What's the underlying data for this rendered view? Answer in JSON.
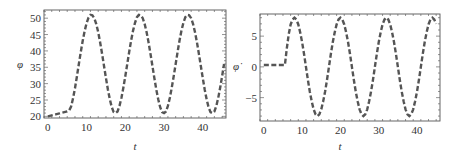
{
  "chart_data": [
    {
      "type": "line",
      "title": "",
      "xlabel": "t",
      "ylabel": "φ",
      "xlim": [
        -1,
        46
      ],
      "ylim": [
        19.5,
        52.5
      ],
      "x_ticks": [
        0,
        10,
        20,
        30,
        40
      ],
      "x_tick_labels": [
        "0",
        "10",
        "20",
        "30",
        "40"
      ],
      "y_ticks": [
        20,
        25,
        30,
        35,
        40,
        45,
        50
      ],
      "y_tick_labels": [
        "20",
        "25",
        "30",
        "35",
        "40",
        "45",
        "50"
      ],
      "grid": false,
      "legend": null,
      "series": [
        {
          "name": "phi",
          "style": "dashed",
          "color": "#555555",
          "x": [
            0,
            1,
            2,
            3,
            4,
            5,
            5.5,
            6,
            6.5,
            7,
            7.5,
            8,
            8.5,
            9,
            9.5,
            10,
            10.5,
            11,
            11.5,
            12,
            12.5,
            13,
            13.5,
            14,
            14.5,
            15,
            15.5,
            16,
            16.5,
            17,
            17.5,
            18,
            18.5,
            19,
            19.5,
            20,
            20.5,
            21,
            21.5,
            22,
            22.5,
            23,
            23.5,
            24,
            24.5,
            25,
            25.5,
            26,
            26.5,
            27,
            27.5,
            28,
            28.5,
            29,
            29.5,
            30,
            30.5,
            31,
            31.5,
            32,
            32.5,
            33,
            33.5,
            34,
            34.5,
            35,
            35.5,
            36,
            36.5,
            37,
            37.5,
            38,
            38.5,
            39,
            39.5,
            40,
            40.5,
            41,
            41.5,
            42,
            42.5,
            43,
            43.5,
            44,
            44.5,
            45,
            45.5
          ],
          "y": [
            20.0,
            20.3,
            20.6,
            20.9,
            21.2,
            21.5,
            21.8,
            23.0,
            25.5,
            28.6,
            32.2,
            36.0,
            39.7,
            43.1,
            46.1,
            48.5,
            50.2,
            51.0,
            50.9,
            50.0,
            48.2,
            45.7,
            42.6,
            39.1,
            35.4,
            31.7,
            28.2,
            25.2,
            22.8,
            21.3,
            21.0,
            21.5,
            23.2,
            25.7,
            28.8,
            32.3,
            36.0,
            39.7,
            43.2,
            46.2,
            48.6,
            50.3,
            51.0,
            50.9,
            50.0,
            48.2,
            45.7,
            42.6,
            39.1,
            35.4,
            31.7,
            28.2,
            25.2,
            22.8,
            21.3,
            21.0,
            21.5,
            23.2,
            25.7,
            28.8,
            32.3,
            36.0,
            39.7,
            43.2,
            46.2,
            48.6,
            50.3,
            51.0,
            50.9,
            50.0,
            48.2,
            45.7,
            42.6,
            39.1,
            35.4,
            31.7,
            28.2,
            25.2,
            22.8,
            21.3,
            21.0,
            21.5,
            23.2,
            25.7,
            28.8,
            32.3,
            36.0,
            39.7,
            43.2
          ]
        }
      ]
    },
    {
      "type": "line",
      "title": "",
      "xlabel": "t",
      "ylabel": "φ̇",
      "xlim": [
        -1,
        46
      ],
      "ylim": [
        -8.8,
        8.6
      ],
      "x_ticks": [
        0,
        10,
        20,
        30,
        40
      ],
      "x_tick_labels": [
        "0",
        "10",
        "20",
        "30",
        "40"
      ],
      "y_ticks": [
        -5,
        0,
        5
      ],
      "y_tick_labels": [
        "−5",
        "0",
        "5"
      ],
      "grid": false,
      "legend": null,
      "series": [
        {
          "name": "phi_dot",
          "style": "dashed",
          "color": "#555555",
          "x": [
            0,
            1,
            2,
            3,
            4,
            5,
            5.5,
            6,
            6.5,
            7,
            7.5,
            8,
            8.5,
            9,
            9.5,
            10,
            10.5,
            11,
            11.5,
            12,
            12.5,
            13,
            13.5,
            14,
            14.5,
            15,
            15.5,
            16,
            16.5,
            17,
            17.5,
            18,
            18.5,
            19,
            19.5,
            20,
            20.5,
            21,
            21.5,
            22,
            22.5,
            23,
            23.5,
            24,
            24.5,
            25,
            25.5,
            26,
            26.5,
            27,
            27.5,
            28,
            28.5,
            29,
            29.5,
            30,
            30.5,
            31,
            31.5,
            32,
            32.5,
            33,
            33.5,
            34,
            34.5,
            35,
            35.5,
            36,
            36.5,
            37,
            37.5,
            38,
            38.5,
            39,
            39.5,
            40,
            40.5,
            41,
            41.5,
            42,
            42.5,
            43,
            43.5,
            44,
            44.5,
            45,
            45.5
          ],
          "y": [
            0.3,
            0.3,
            0.3,
            0.3,
            0.3,
            0.3,
            0.3,
            3.0,
            5.3,
            6.9,
            7.7,
            8.0,
            7.7,
            6.9,
            5.6,
            4.0,
            2.1,
            0.0,
            -2.1,
            -4.0,
            -5.6,
            -6.9,
            -7.7,
            -8.0,
            -7.7,
            -6.9,
            -5.6,
            -4.0,
            -2.1,
            0.0,
            2.1,
            4.0,
            5.6,
            6.9,
            7.7,
            8.0,
            7.7,
            6.9,
            5.6,
            4.0,
            2.1,
            0.0,
            -2.1,
            -4.0,
            -5.6,
            -6.9,
            -7.7,
            -8.0,
            -7.7,
            -6.9,
            -5.6,
            -4.0,
            -2.1,
            0.0,
            2.1,
            4.0,
            5.6,
            6.9,
            7.7,
            8.0,
            7.7,
            6.9,
            5.6,
            4.0,
            2.1,
            0.0,
            -2.1,
            -4.0,
            -5.6,
            -6.9,
            -7.7,
            -8.0,
            -7.7,
            -6.9,
            -5.6,
            -4.0,
            -2.1,
            0.0,
            2.1,
            4.0,
            5.6,
            6.9,
            7.7,
            8.0,
            7.7,
            7.0
          ]
        }
      ]
    }
  ]
}
